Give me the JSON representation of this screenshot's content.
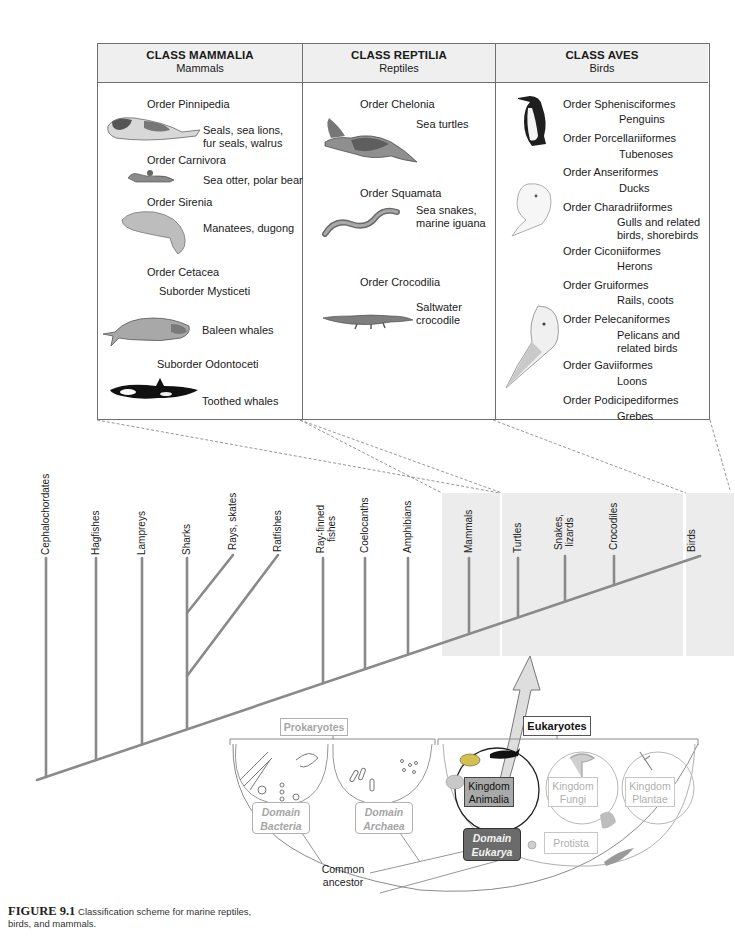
{
  "table": {
    "columns": [
      {
        "class_title": "CLASS MAMMALIA",
        "common_name": "Mammals",
        "entries": [
          {
            "rank": "Order Pinnipedia",
            "examples": [
              "Seals, sea lions,",
              "fur seals, walrus"
            ],
            "illustration": "seal-illustration"
          },
          {
            "rank": "Order Carnivora",
            "examples": [
              "Sea otter, polar bear"
            ],
            "illustration": "sea-otter-illustration"
          },
          {
            "rank": "Order Sirenia",
            "examples": [
              "Manatees, dugong"
            ],
            "illustration": "manatee-illustration"
          },
          {
            "rank": "Order Cetacea",
            "examples": [],
            "illustration": ""
          },
          {
            "rank": "Suborder Mysticeti",
            "examples": [
              "Baleen whales"
            ],
            "illustration": "baleen-whale-illustration"
          },
          {
            "rank": "Suborder Odontoceti",
            "examples": [
              "Toothed whales"
            ],
            "illustration": "orca-illustration"
          }
        ]
      },
      {
        "class_title": "CLASS REPTILIA",
        "common_name": "Reptiles",
        "entries": [
          {
            "rank": "Order Chelonia",
            "examples": [
              "Sea turtles"
            ],
            "illustration": "sea-turtle-illustration"
          },
          {
            "rank": "Order Squamata",
            "examples": [
              "Sea snakes,",
              "marine iguana"
            ],
            "illustration": "sea-snake-illustration"
          },
          {
            "rank": "Order Crocodilia",
            "examples": [
              "Saltwater",
              "crocodile"
            ],
            "illustration": "crocodile-illustration"
          }
        ]
      },
      {
        "class_title": "CLASS AVES",
        "common_name": "Birds",
        "entries": [
          {
            "rank": "Order Sphenisciformes",
            "examples": [
              "Penguins"
            ],
            "illustration": "penguin-illustration"
          },
          {
            "rank": "Order Porcellariiformes",
            "examples": [
              "Tubenoses"
            ],
            "illustration": ""
          },
          {
            "rank": "Order Anseriformes",
            "examples": [
              "Ducks"
            ],
            "illustration": ""
          },
          {
            "rank": "Order Charadriiformes",
            "examples": [
              "Gulls and related",
              "birds, shorebirds"
            ],
            "illustration": "gull-illustration"
          },
          {
            "rank": "Order Ciconiiformes",
            "examples": [
              "Herons"
            ],
            "illustration": ""
          },
          {
            "rank": "Order Gruiformes",
            "examples": [
              "Rails, coots"
            ],
            "illustration": ""
          },
          {
            "rank": "Order Pelecaniformes",
            "examples": [
              "Pelicans and",
              "related birds"
            ],
            "illustration": "pelican-illustration"
          },
          {
            "rank": "Order Gaviiformes",
            "examples": [
              "Loons"
            ],
            "illustration": ""
          },
          {
            "rank": "Order Podicipediformes",
            "examples": [
              "Grebes"
            ],
            "illustration": ""
          }
        ]
      }
    ]
  },
  "tree": {
    "taxa": [
      {
        "label": "Cephalochordates"
      },
      {
        "label": "Hagfishes"
      },
      {
        "label": "Lampreys"
      },
      {
        "label": "Sharks"
      },
      {
        "label": "Rays, skates"
      },
      {
        "label": "Ratfishes"
      },
      {
        "label": "Ray-finned fishes"
      },
      {
        "label": "Coelocanths"
      },
      {
        "label": "Amphibians"
      },
      {
        "label": "Mammals"
      },
      {
        "label": "Turtles"
      },
      {
        "label": "Snakes, lizards"
      },
      {
        "label": "Crocodiles"
      },
      {
        "label": "Birds"
      }
    ]
  },
  "domains": {
    "prokaryotes_label": "Prokaryotes",
    "eukaryotes_label": "Eukaryotes",
    "bacteria": [
      "Domain",
      "Bacteria"
    ],
    "archaea": [
      "Domain",
      "Archaea"
    ],
    "eukarya": [
      "Domain",
      "Eukarya"
    ],
    "animalia": [
      "Kingdom",
      "Animalia"
    ],
    "fungi": [
      "Kingdom",
      "Fungi"
    ],
    "plantae": [
      "Kingdom",
      "Plantae"
    ],
    "protista": "Protista",
    "common_ancestor": [
      "Common",
      "ancestor"
    ]
  },
  "caption": {
    "figure_label": "FIGURE 9.1",
    "text": "Classification scheme for marine reptiles, birds, and mammals."
  },
  "colors": {
    "branch": "#8a8a8a",
    "shade": "#ececec",
    "eukarya_fill": "#6b6b6b",
    "animalia_fill": "#a9a9a9",
    "faded_text": "#a6a6a6"
  }
}
